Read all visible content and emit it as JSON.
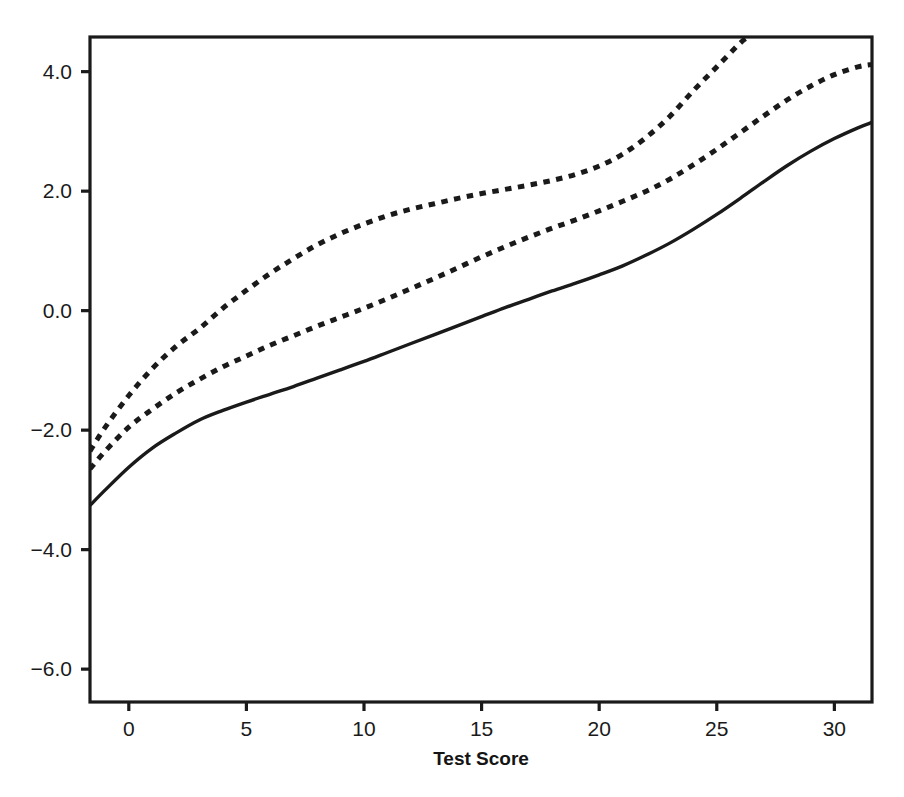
{
  "chart_data": {
    "type": "line",
    "title": "",
    "subtitle": "",
    "xlabel": "Test Score",
    "ylabel": "",
    "xlim": [
      -1.65,
      31.6
    ],
    "ylim": [
      -6.55,
      4.58
    ],
    "x_ticks": [
      0,
      5,
      10,
      15,
      20,
      25,
      30
    ],
    "x_tick_labels": [
      "0",
      "5",
      "10",
      "15",
      "20",
      "25",
      "30"
    ],
    "y_ticks": [
      4.0,
      2.0,
      0.0,
      -2.0,
      -4.0,
      -6.0
    ],
    "y_tick_labels": [
      "4.0",
      "2.0",
      "0.0",
      "-2.0",
      "-4.0",
      "-6.0"
    ],
    "grid": false,
    "legend": "none",
    "frame": "box",
    "background": "#ffffff",
    "line_color": "#1a1a1a",
    "series": [
      {
        "name": "upper-dashed-curve",
        "style": "dashed",
        "color": "#1a1a1a",
        "x": [
          -1.65,
          -1.0,
          0.0,
          1.0,
          2.0,
          3.0,
          4.0,
          5.0,
          6.0,
          7.0,
          8.0,
          9.0,
          10.0,
          11.0,
          12.0,
          13.0,
          14.0,
          15.0,
          16.0,
          17.0,
          18.0,
          19.0,
          20.0,
          21.0,
          22.0,
          23.0,
          24.0,
          25.0,
          26.0,
          26.35
        ],
        "y": [
          -2.35,
          -1.95,
          -1.42,
          -0.97,
          -0.6,
          -0.3,
          0.04,
          0.34,
          0.62,
          0.87,
          1.1,
          1.29,
          1.45,
          1.59,
          1.7,
          1.79,
          1.88,
          1.96,
          2.03,
          2.1,
          2.18,
          2.28,
          2.42,
          2.62,
          2.9,
          3.25,
          3.68,
          4.08,
          4.48,
          4.58
        ]
      },
      {
        "name": "middle-dashed-curve",
        "style": "dashed",
        "color": "#1a1a1a",
        "x": [
          -1.65,
          -1.0,
          0.0,
          1.0,
          2.0,
          3.0,
          4.0,
          5.0,
          6.0,
          7.0,
          8.0,
          9.0,
          10.0,
          11.0,
          12.0,
          13.0,
          14.0,
          15.0,
          16.0,
          17.0,
          18.0,
          19.0,
          20.0,
          21.0,
          22.0,
          23.0,
          24.0,
          25.0,
          26.0,
          27.0,
          28.0,
          29.0,
          30.0,
          31.0,
          31.6
        ],
        "y": [
          -2.65,
          -2.35,
          -1.95,
          -1.65,
          -1.38,
          -1.15,
          -0.94,
          -0.76,
          -0.58,
          -0.42,
          -0.26,
          -0.11,
          0.04,
          0.2,
          0.37,
          0.54,
          0.72,
          0.9,
          1.07,
          1.23,
          1.38,
          1.52,
          1.67,
          1.83,
          2.0,
          2.2,
          2.44,
          2.7,
          2.98,
          3.26,
          3.53,
          3.76,
          3.95,
          4.08,
          4.12
        ]
      },
      {
        "name": "solid-curve",
        "style": "solid",
        "color": "#1a1a1a",
        "x": [
          -1.65,
          -1.0,
          0.0,
          1.0,
          2.0,
          3.0,
          4.0,
          5.0,
          6.0,
          7.0,
          8.0,
          9.0,
          10.0,
          11.0,
          12.0,
          13.0,
          14.0,
          15.0,
          16.0,
          17.0,
          18.0,
          19.0,
          20.0,
          21.0,
          22.0,
          23.0,
          24.0,
          25.0,
          26.0,
          27.0,
          28.0,
          29.0,
          30.0,
          31.0,
          31.6
        ],
        "y": [
          -3.26,
          -3.0,
          -2.62,
          -2.3,
          -2.05,
          -1.83,
          -1.67,
          -1.53,
          -1.4,
          -1.27,
          -1.13,
          -0.99,
          -0.85,
          -0.7,
          -0.55,
          -0.4,
          -0.25,
          -0.1,
          0.05,
          0.19,
          0.33,
          0.46,
          0.6,
          0.75,
          0.93,
          1.13,
          1.36,
          1.61,
          1.88,
          2.16,
          2.43,
          2.67,
          2.88,
          3.06,
          3.15
        ]
      }
    ]
  },
  "axis_title": {
    "x": "Test Score"
  }
}
